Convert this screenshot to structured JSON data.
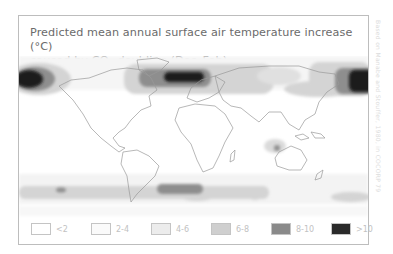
{
  "figure": {
    "title_line1": "Predicted mean annual surface air temperature increase (°C)",
    "title_line2_prefix": "caused by CO",
    "title_line2_sub": "2",
    "title_line2_suffix": " doubling (Dec–Feb)",
    "credit": "Based on Manabe and Stouffer, 1980, in COCORP 79"
  },
  "legend": {
    "items": [
      {
        "label": "<2",
        "color": "#ffffff"
      },
      {
        "label": "2-4",
        "color": "#fafafa"
      },
      {
        "label": "4-6",
        "color": "#ececec"
      },
      {
        "label": "6-8",
        "color": "#cfcfcf"
      },
      {
        "label": "8-10",
        "color": "#8a8a8a"
      },
      {
        "label": ">10",
        "color": "#2a2a2a"
      }
    ]
  },
  "map": {
    "projection": "equirectangular world map",
    "coastline_color": "#8f8f8f",
    "zones": [
      {
        "region": "Bering / Arctic Pacific (left edge)",
        "class": ">10"
      },
      {
        "region": "Northern Europe / Scandinavia Arctic",
        "class": ">10"
      },
      {
        "region": "Eastern Siberia / Bering (right edge)",
        "class": ">10"
      },
      {
        "region": "Arctic band over Eurasia",
        "class": "6-8"
      },
      {
        "region": "Southern Ocean band",
        "class": "6-8"
      },
      {
        "region": "Southern Ocean south of Atlantic",
        "class": "8-10"
      },
      {
        "region": "Central Australia",
        "class": "6-8"
      }
    ]
  }
}
